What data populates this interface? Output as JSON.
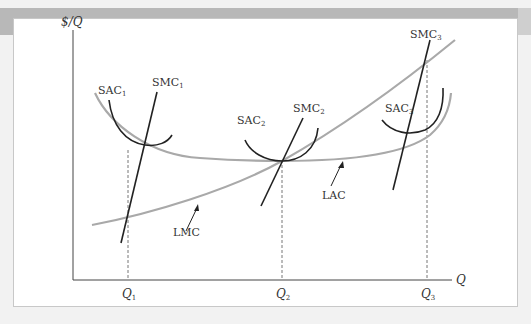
{
  "figure": {
    "axes": {
      "y_label": "$/Q",
      "x_label": "Q"
    },
    "quantities": [
      {
        "label": "Q",
        "sub": "1"
      },
      {
        "label": "Q",
        "sub": "2"
      },
      {
        "label": "Q",
        "sub": "3"
      }
    ],
    "curves": {
      "sac1": {
        "label": "SAC",
        "sub": "1"
      },
      "smc1": {
        "label": "SMC",
        "sub": "1"
      },
      "sac2": {
        "label": "SAC",
        "sub": "2"
      },
      "smc2": {
        "label": "SMC",
        "sub": "2"
      },
      "sac3": {
        "label": "SAC",
        "sub": "3"
      },
      "smc3": {
        "label": "SMC",
        "sub": "3"
      },
      "lac": {
        "label": "LAC"
      },
      "lmc": {
        "label": "LMC"
      }
    },
    "colors": {
      "long_run_curve": "#a9a9a9",
      "short_run_curve": "#222222",
      "axis": "#444444",
      "dashed_guide": "#777777",
      "banner": "#b8b8b8"
    }
  }
}
